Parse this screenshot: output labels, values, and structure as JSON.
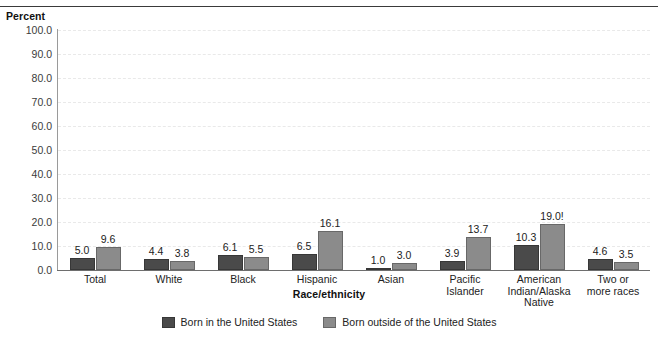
{
  "chart_data": {
    "type": "bar",
    "title": "",
    "xlabel": "Race/ethnicity",
    "ylabel": "Percent",
    "ylim": [
      0,
      100
    ],
    "ytick_step": 10,
    "ytick_labels": [
      "0.0",
      "10.0",
      "20.0",
      "30.0",
      "40.0",
      "50.0",
      "60.0",
      "70.0",
      "80.0",
      "90.0",
      "100.0"
    ],
    "grid": "horizontal-dashed",
    "legend_position": "bottom-center",
    "categories": [
      "Total",
      "White",
      "Black",
      "Hispanic",
      "Asian",
      "Pacific\nIslander",
      "American\nIndian/Alaska\nNative",
      "Two or\nmore races"
    ],
    "category_lines": [
      [
        "Total"
      ],
      [
        "White"
      ],
      [
        "Black"
      ],
      [
        "Hispanic"
      ],
      [
        "Asian"
      ],
      [
        "Pacific",
        "Islander"
      ],
      [
        "American",
        "Indian/Alaska",
        "Native"
      ],
      [
        "Two or",
        "more races"
      ]
    ],
    "series": [
      {
        "name": "Born in the United States",
        "color": "#4a4a4a",
        "values": [
          5.0,
          4.4,
          6.1,
          6.5,
          1.0,
          3.9,
          10.3,
          4.6
        ],
        "labels": [
          "5.0",
          "4.4",
          "6.1",
          "6.5",
          "1.0",
          "3.9",
          "10.3",
          "4.6"
        ]
      },
      {
        "name": "Born outside of the United States",
        "color": "#8b8b8b",
        "values": [
          9.6,
          3.8,
          5.5,
          16.1,
          3.0,
          13.7,
          19.0,
          3.5
        ],
        "labels": [
          "9.6",
          "3.8",
          "5.5",
          "16.1",
          "3.0",
          "13.7",
          "19.0!",
          "3.5"
        ]
      }
    ]
  },
  "axes": {
    "y_title": "Percent",
    "x_title": "Race/ethnicity"
  },
  "legend": {
    "items": [
      {
        "label": "Born in the United States",
        "color": "#4a4a4a"
      },
      {
        "label": "Born outside of the United States",
        "color": "#8b8b8b"
      }
    ]
  },
  "colors": {
    "series_born_in_us": "#4a4a4a",
    "series_born_outside_us": "#8b8b8b",
    "gridline": "#e9e9e9",
    "axis": "#6e6e6e",
    "top_rule": "#3a3a3a",
    "text": "#222222",
    "background": "#ffffff"
  }
}
